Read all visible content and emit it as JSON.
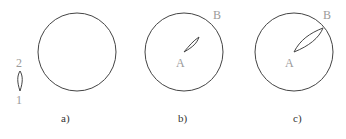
{
  "figure": {
    "panels": [
      {
        "caption": "a)",
        "labels": {
          "top": "2",
          "bottom": "1"
        },
        "circle": {
          "cx": 77,
          "cy": 52,
          "r": 39
        }
      },
      {
        "caption": "b)",
        "labels": {
          "center": "A",
          "edge": "B"
        },
        "circle": {
          "cx": 184,
          "cy": 52,
          "r": 39
        }
      },
      {
        "caption": "c)",
        "labels": {
          "center": "A",
          "edge": "B"
        },
        "circle": {
          "cx": 294,
          "cy": 52,
          "r": 39
        }
      }
    ],
    "colors": {
      "stroke": "#444444",
      "label": "#9a9a9a",
      "caption": "#333333"
    }
  }
}
